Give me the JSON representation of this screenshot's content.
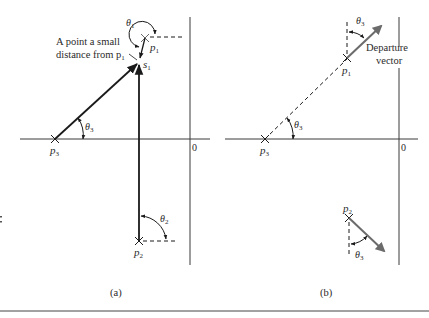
{
  "figure": {
    "panels": [
      {
        "id": "a",
        "caption": "(a)",
        "origin_label": "0",
        "annotation": [
          "A point a small",
          "distance from p"
        ],
        "annotation_sub": "1",
        "points": {
          "p1": {
            "label": "p",
            "sub": "1"
          },
          "p2": {
            "label": "p",
            "sub": "2"
          },
          "p3": {
            "label": "p",
            "sub": "3"
          },
          "s1": {
            "label": "s",
            "sub": "1"
          }
        },
        "angles": {
          "theta1": {
            "label": "θ",
            "sub": "1"
          },
          "theta2": {
            "label": "θ",
            "sub": "2"
          },
          "theta3": {
            "label": "θ",
            "sub": "3"
          }
        }
      },
      {
        "id": "b",
        "caption": "(b)",
        "origin_label": "0",
        "vector_label": [
          "Departure",
          "vector"
        ],
        "points": {
          "p1": {
            "label": "p",
            "sub": "1"
          },
          "p2": {
            "label": "p",
            "sub": "2"
          },
          "p3": {
            "label": "p",
            "sub": "3"
          }
        },
        "angles": {
          "theta3_top": {
            "label": "θ",
            "sub": "3"
          },
          "theta3_p3": {
            "label": "θ",
            "sub": "3"
          },
          "theta3_p2": {
            "label": "θ",
            "sub": "3"
          }
        }
      }
    ],
    "colors": {
      "ink": "#1a1a1a",
      "axis": "#3a3a3a",
      "vector": "#6b6b6b"
    }
  }
}
